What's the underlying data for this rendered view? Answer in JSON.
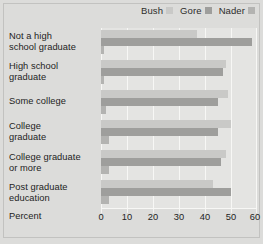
{
  "chart_data": {
    "type": "bar",
    "orientation": "horizontal",
    "title": "",
    "xlabel": "Percent",
    "ylabel": "",
    "xlim": [
      0,
      60
    ],
    "xticks": [
      0,
      10,
      20,
      30,
      40,
      50,
      60
    ],
    "grid": true,
    "legend_position": "top-right",
    "categories": [
      "Not a high school graduate",
      "High school graduate",
      "Some college",
      "College graduate",
      "College graduate or more",
      "Post graduate education"
    ],
    "category_lines": [
      [
        "Not a high",
        "school graduate"
      ],
      [
        "High school",
        "graduate"
      ],
      [
        "Some college",
        ""
      ],
      [
        "College",
        "graduate"
      ],
      [
        "College graduate",
        "or more"
      ],
      [
        "Post graduate",
        "education"
      ]
    ],
    "series": [
      {
        "name": "Bush",
        "color": "#c9c9c7",
        "values": [
          37,
          48,
          49,
          50,
          48,
          43
        ]
      },
      {
        "name": "Gore",
        "color": "#9e9e9c",
        "values": [
          58,
          47,
          45,
          45,
          46,
          50
        ]
      },
      {
        "name": "Nader",
        "color": "#b3b3b1",
        "values": [
          1,
          1,
          2,
          3,
          3,
          3
        ]
      }
    ]
  },
  "legend": {
    "items": [
      {
        "label": "Bush",
        "color": "#c9c9c7"
      },
      {
        "label": "Gore",
        "color": "#9e9e9c"
      },
      {
        "label": "Nader",
        "color": "#b3b3b1"
      }
    ]
  },
  "axis": {
    "percent_label": "Percent",
    "tick_labels": [
      "0",
      "10",
      "20",
      "30",
      "40",
      "50",
      "60"
    ]
  }
}
